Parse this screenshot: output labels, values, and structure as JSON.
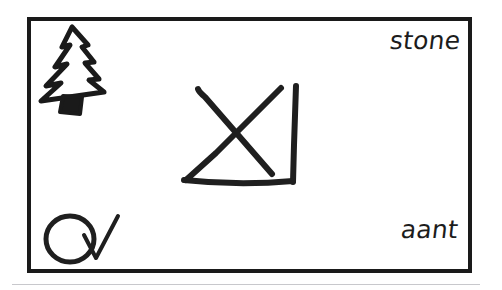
{
  "card": {
    "frame": {
      "name": "card-border",
      "color": "#1a1a1a",
      "stroke_width": 4,
      "x": 27,
      "y": 17,
      "width": 445,
      "height": 256
    },
    "background_color": "#ffffff",
    "ink_color": "#1c1c1c"
  },
  "drawings": {
    "tree": {
      "name": "pine-tree-drawing",
      "description": "hand-drawn fir tree outline with filled trunk",
      "position": "top-left"
    },
    "cross_box": {
      "name": "crossed-out-box-drawing",
      "description": "large hand-drawn X with partial square outline (right and bottom edges)",
      "position": "center"
    },
    "circle_check": {
      "name": "circle-check-drawing",
      "description": "hand-drawn circle followed by a checkmark",
      "position": "bottom-left"
    }
  },
  "labels": {
    "top_right": "stone",
    "bottom_right": "aant"
  },
  "rule": {
    "name": "page-baseline-rule",
    "color": "#c8c8cc"
  }
}
